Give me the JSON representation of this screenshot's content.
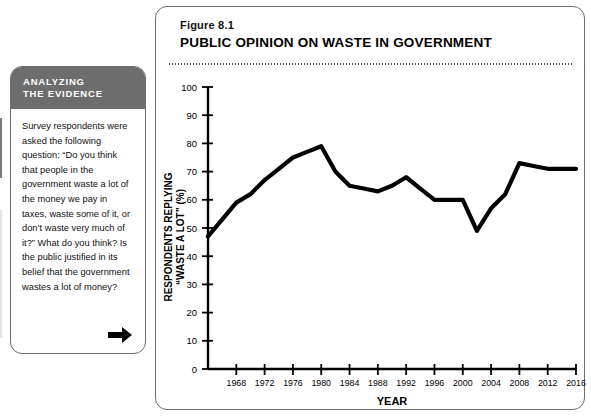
{
  "page": {
    "ghost_header": "WHY DON'T AMERICANS"
  },
  "sidebar": {
    "header_line1": "ANALYZING",
    "header_line2": "THE EVIDENCE",
    "body": "Survey respondents were asked the following question: “Do you think that people in the government waste a lot of the money we pay in taxes, waste some of it, or don’t waste very much of it?” What do you think? Is the public justified in its belief that the government wastes a lot of money?",
    "arrow_icon": "arrow-right-icon"
  },
  "figure": {
    "number": "Figure 8.1",
    "title": "PUBLIC OPINION ON WASTE IN GOVERNMENT"
  },
  "chart_data": {
    "type": "line",
    "title": "PUBLIC OPINION ON WASTE IN GOVERNMENT",
    "xlabel": "YEAR",
    "ylabel": "RESPONDENTS REPLYING “WASTE A LOT” (%)",
    "xlim": [
      1964,
      2016
    ],
    "ylim": [
      0,
      100
    ],
    "grid": false,
    "legend": null,
    "y_ticks": [
      0,
      10,
      20,
      30,
      40,
      50,
      60,
      70,
      80,
      90,
      100
    ],
    "x_ticks": [
      1968,
      1972,
      1976,
      1980,
      1984,
      1988,
      1992,
      1996,
      2000,
      2004,
      2008,
      2012,
      2016
    ],
    "x": [
      1964,
      1968,
      1970,
      1972,
      1974,
      1976,
      1978,
      1980,
      1982,
      1984,
      1986,
      1988,
      1990,
      1992,
      1994,
      1996,
      1998,
      2000,
      2002,
      2004,
      2006,
      2008,
      2010,
      2012,
      2014,
      2016
    ],
    "values": [
      47,
      59,
      62,
      67,
      71,
      75,
      77,
      79,
      70,
      65,
      64,
      63,
      65,
      68,
      64,
      60,
      60,
      60,
      49,
      57,
      62,
      73,
      72,
      71,
      71,
      71
    ],
    "series": [
      {
        "name": "Respondents replying “waste a lot”",
        "color": "#000000",
        "values": [
          47,
          59,
          62,
          67,
          71,
          75,
          77,
          79,
          70,
          65,
          64,
          63,
          65,
          68,
          64,
          60,
          60,
          60,
          49,
          57,
          62,
          73,
          72,
          71,
          71,
          71
        ]
      }
    ]
  }
}
